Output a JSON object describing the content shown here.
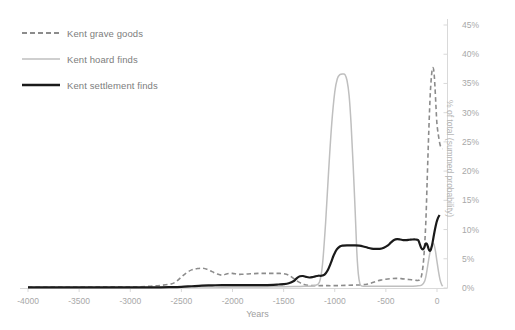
{
  "chart_data": {
    "type": "line",
    "title": "",
    "xlabel": "Years",
    "ylabel": "% of total (summed probability)",
    "xlim": [
      -4000,
      200
    ],
    "ylim": [
      0,
      45
    ],
    "grid": false,
    "legend_position": "top-left",
    "x_ticks": [
      -4000,
      -3500,
      -3000,
      -2500,
      -2000,
      -1500,
      -1000,
      -500,
      0
    ],
    "x_tick_labels": [
      "-4000",
      "-3500",
      "-3000",
      "-2500",
      "-2000",
      "-1500",
      "-1000",
      "-500",
      "0"
    ],
    "y_ticks": [
      0,
      5,
      10,
      15,
      20,
      25,
      30,
      35,
      40,
      45
    ],
    "y_tick_labels": [
      "0%",
      "5%",
      "10%",
      "15%",
      "20%",
      "25%",
      "30%",
      "35%",
      "40%",
      "45%"
    ],
    "y_axis_side": "right",
    "series": [
      {
        "name": "Kent grave goods",
        "style": "dashed",
        "color": "#8c8c8c",
        "width": 1.6,
        "points": [
          [
            -4000,
            0.15
          ],
          [
            -3800,
            0.15
          ],
          [
            -3600,
            0.15
          ],
          [
            -3400,
            0.18
          ],
          [
            -3200,
            0.2
          ],
          [
            -3000,
            0.2
          ],
          [
            -2900,
            0.22
          ],
          [
            -2800,
            0.3
          ],
          [
            -2700,
            0.45
          ],
          [
            -2600,
            0.7
          ],
          [
            -2550,
            1.1
          ],
          [
            -2500,
            1.9
          ],
          [
            -2450,
            2.6
          ],
          [
            -2400,
            3.1
          ],
          [
            -2350,
            3.3
          ],
          [
            -2300,
            3.4
          ],
          [
            -2250,
            3.2
          ],
          [
            -2200,
            2.8
          ],
          [
            -2150,
            2.4
          ],
          [
            -2100,
            2.2
          ],
          [
            -2050,
            2.45
          ],
          [
            -2000,
            2.5
          ],
          [
            -1950,
            2.35
          ],
          [
            -1900,
            2.35
          ],
          [
            -1850,
            2.4
          ],
          [
            -1800,
            2.45
          ],
          [
            -1750,
            2.5
          ],
          [
            -1700,
            2.5
          ],
          [
            -1650,
            2.5
          ],
          [
            -1600,
            2.5
          ],
          [
            -1550,
            2.5
          ],
          [
            -1500,
            2.45
          ],
          [
            -1450,
            2.2
          ],
          [
            -1400,
            1.6
          ],
          [
            -1350,
            1.0
          ],
          [
            -1300,
            0.6
          ],
          [
            -1250,
            0.45
          ],
          [
            -1200,
            0.4
          ],
          [
            -1100,
            0.4
          ],
          [
            -1000,
            0.4
          ],
          [
            -900,
            0.45
          ],
          [
            -800,
            0.5
          ],
          [
            -700,
            0.6
          ],
          [
            -650,
            0.8
          ],
          [
            -600,
            1.1
          ],
          [
            -550,
            1.35
          ],
          [
            -500,
            1.5
          ],
          [
            -450,
            1.6
          ],
          [
            -400,
            1.65
          ],
          [
            -350,
            1.6
          ],
          [
            -300,
            1.5
          ],
          [
            -250,
            1.4
          ],
          [
            -200,
            1.3
          ],
          [
            -170,
            1.4
          ],
          [
            -150,
            2.2
          ],
          [
            -130,
            5.0
          ],
          [
            -110,
            11.0
          ],
          [
            -95,
            19.0
          ],
          [
            -80,
            27.0
          ],
          [
            -65,
            33.5
          ],
          [
            -50,
            37.0
          ],
          [
            -40,
            37.7
          ],
          [
            -30,
            37.0
          ],
          [
            -20,
            34.5
          ],
          [
            -10,
            31.0
          ],
          [
            0,
            28.0
          ],
          [
            15,
            26.0
          ],
          [
            30,
            24.5
          ],
          [
            45,
            24.0
          ],
          [
            55,
            23.8
          ]
        ]
      },
      {
        "name": "Kent hoard finds",
        "style": "solid",
        "color": "#bfbfbf",
        "width": 1.5,
        "points": [
          [
            -4000,
            0.1
          ],
          [
            -3500,
            0.1
          ],
          [
            -3000,
            0.1
          ],
          [
            -2600,
            0.12
          ],
          [
            -2400,
            0.15
          ],
          [
            -2200,
            0.15
          ],
          [
            -2000,
            0.15
          ],
          [
            -1800,
            0.18
          ],
          [
            -1600,
            0.2
          ],
          [
            -1500,
            0.22
          ],
          [
            -1400,
            0.25
          ],
          [
            -1300,
            0.3
          ],
          [
            -1200,
            0.4
          ],
          [
            -1150,
            1.0
          ],
          [
            -1120,
            4.0
          ],
          [
            -1090,
            11.0
          ],
          [
            -1060,
            20.0
          ],
          [
            -1030,
            28.0
          ],
          [
            -1000,
            33.5
          ],
          [
            -975,
            35.8
          ],
          [
            -950,
            36.5
          ],
          [
            -920,
            36.6
          ],
          [
            -900,
            36.5
          ],
          [
            -880,
            35.5
          ],
          [
            -860,
            33.0
          ],
          [
            -840,
            28.0
          ],
          [
            -820,
            21.0
          ],
          [
            -800,
            13.0
          ],
          [
            -785,
            6.5
          ],
          [
            -770,
            2.5
          ],
          [
            -755,
            0.8
          ],
          [
            -740,
            0.35
          ],
          [
            -700,
            0.3
          ],
          [
            -600,
            0.3
          ],
          [
            -500,
            0.3
          ],
          [
            -400,
            0.3
          ],
          [
            -300,
            0.3
          ],
          [
            -200,
            0.35
          ],
          [
            -150,
            0.5
          ],
          [
            -120,
            1.2
          ],
          [
            -100,
            2.8
          ],
          [
            -80,
            5.0
          ],
          [
            -60,
            6.8
          ],
          [
            -45,
            7.6
          ],
          [
            -30,
            7.5
          ],
          [
            -15,
            6.3
          ],
          [
            0,
            4.5
          ],
          [
            15,
            2.8
          ],
          [
            30,
            1.4
          ],
          [
            45,
            0.6
          ],
          [
            55,
            0.3
          ]
        ]
      },
      {
        "name": "Kent settlement finds",
        "style": "solid",
        "color": "#1a1a1a",
        "width": 2.2,
        "points": [
          [
            -4000,
            0.1
          ],
          [
            -3500,
            0.1
          ],
          [
            -3000,
            0.1
          ],
          [
            -2700,
            0.12
          ],
          [
            -2600,
            0.15
          ],
          [
            -2500,
            0.2
          ],
          [
            -2400,
            0.3
          ],
          [
            -2300,
            0.4
          ],
          [
            -2200,
            0.45
          ],
          [
            -2100,
            0.5
          ],
          [
            -2000,
            0.5
          ],
          [
            -1900,
            0.5
          ],
          [
            -1800,
            0.5
          ],
          [
            -1700,
            0.5
          ],
          [
            -1600,
            0.55
          ],
          [
            -1550,
            0.6
          ],
          [
            -1500,
            0.65
          ],
          [
            -1450,
            0.8
          ],
          [
            -1400,
            1.2
          ],
          [
            -1370,
            1.7
          ],
          [
            -1340,
            2.0
          ],
          [
            -1310,
            2.05
          ],
          [
            -1280,
            1.9
          ],
          [
            -1250,
            1.8
          ],
          [
            -1220,
            1.85
          ],
          [
            -1190,
            2.0
          ],
          [
            -1160,
            2.1
          ],
          [
            -1130,
            2.1
          ],
          [
            -1100,
            2.3
          ],
          [
            -1070,
            3.0
          ],
          [
            -1040,
            4.2
          ],
          [
            -1010,
            5.6
          ],
          [
            -980,
            6.6
          ],
          [
            -950,
            7.1
          ],
          [
            -920,
            7.25
          ],
          [
            -880,
            7.3
          ],
          [
            -840,
            7.3
          ],
          [
            -800,
            7.3
          ],
          [
            -760,
            7.25
          ],
          [
            -720,
            7.1
          ],
          [
            -680,
            6.9
          ],
          [
            -640,
            6.75
          ],
          [
            -600,
            6.7
          ],
          [
            -560,
            6.7
          ],
          [
            -520,
            6.9
          ],
          [
            -480,
            7.3
          ],
          [
            -450,
            7.8
          ],
          [
            -420,
            8.2
          ],
          [
            -390,
            8.35
          ],
          [
            -360,
            8.3
          ],
          [
            -330,
            8.2
          ],
          [
            -300,
            8.2
          ],
          [
            -270,
            8.25
          ],
          [
            -240,
            8.3
          ],
          [
            -210,
            8.3
          ],
          [
            -185,
            8.2
          ],
          [
            -170,
            7.6
          ],
          [
            -155,
            6.9
          ],
          [
            -140,
            6.6
          ],
          [
            -125,
            6.9
          ],
          [
            -110,
            7.6
          ],
          [
            -95,
            7.4
          ],
          [
            -80,
            6.6
          ],
          [
            -65,
            6.4
          ],
          [
            -50,
            7.2
          ],
          [
            -35,
            8.6
          ],
          [
            -20,
            10.0
          ],
          [
            -5,
            11.2
          ],
          [
            10,
            12.0
          ],
          [
            25,
            12.5
          ]
        ]
      }
    ]
  },
  "legend": {
    "items": [
      {
        "label": "Kent grave goods"
      },
      {
        "label": "Kent hoard finds"
      },
      {
        "label": "Kent settlement finds"
      }
    ]
  },
  "axes": {
    "x_title": "Years",
    "y_title": "% of total (summed probability)"
  },
  "colors": {
    "grave_goods": "#8c8c8c",
    "hoard_finds": "#bfbfbf",
    "settlement_finds": "#1a1a1a",
    "axis": "#d9d9d9",
    "tick_text": "#a8a8a8",
    "background": "#ffffff"
  }
}
